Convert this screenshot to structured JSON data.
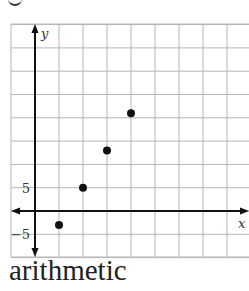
{
  "caption": "arithmetic",
  "chart_data": {
    "type": "scatter",
    "title": "",
    "xlabel": "x",
    "ylabel": "y",
    "x": [
      1,
      2,
      3,
      4
    ],
    "y": [
      -3,
      5,
      13,
      21
    ],
    "ytick_labels": [
      "5",
      "−5"
    ],
    "y_grid_step": 5,
    "x_grid_step": 1,
    "xlim": [
      -1,
      9
    ],
    "ylim": [
      -10,
      40
    ],
    "grid": true,
    "legend": null
  },
  "colors": {
    "grid": "#b5b5b5",
    "axis": "#111111",
    "point": "#111111"
  }
}
